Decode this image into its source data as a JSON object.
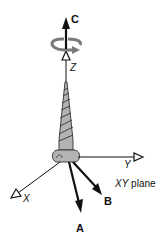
{
  "diagram": {
    "labels": {
      "c": "C",
      "z": "Z",
      "y": "Y",
      "x": "X",
      "a": "A",
      "b": "B",
      "plane_axes": "XY",
      "plane_word": " plane"
    },
    "colors": {
      "line": "#111111",
      "screw_fill": "#b3b3b3",
      "screw_stroke": "#333333",
      "rotation": "#7a7a7a"
    },
    "elements": [
      {
        "name": "vector-c",
        "label": "C",
        "type": "solid-arrow",
        "direction": "up"
      },
      {
        "name": "rotation-arrow",
        "type": "curved-arrow",
        "around": "Z"
      },
      {
        "name": "z-axis",
        "label": "Z",
        "type": "open-arrow"
      },
      {
        "name": "screw",
        "type": "illustration"
      },
      {
        "name": "y-axis",
        "label": "Y",
        "type": "open-arrow"
      },
      {
        "name": "x-axis",
        "label": "X",
        "type": "open-arrow"
      },
      {
        "name": "vector-a",
        "label": "A",
        "type": "solid-arrow"
      },
      {
        "name": "vector-b",
        "label": "B",
        "type": "solid-arrow"
      },
      {
        "name": "plane-label",
        "label": "XY plane"
      }
    ]
  }
}
